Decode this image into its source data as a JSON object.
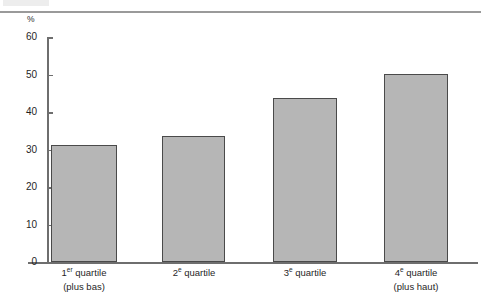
{
  "chart_data": {
    "type": "bar",
    "title": "",
    "subtitle": "",
    "xlabel": "",
    "ylabel": "",
    "unit_label": "%",
    "ylim": [
      0,
      60
    ],
    "ytick_step": 10,
    "yticks": [
      "60",
      "50",
      "40",
      "30",
      "20",
      "10",
      "0"
    ],
    "ytick_values": [
      60,
      50,
      40,
      30,
      20,
      10,
      0
    ],
    "grid": false,
    "legend": false,
    "legend_position": "none",
    "categories": [
      "1er quartile (plus bas)",
      "2e quartile",
      "3e quartile",
      "4e quartile (plus haut)"
    ],
    "values": [
      31.2,
      33.6,
      43.7,
      50.2
    ],
    "series": [
      {
        "name": "",
        "values": [
          31.2,
          33.6,
          43.7,
          50.2
        ]
      }
    ],
    "bars": [
      {
        "value": 31.2,
        "label_main": "1",
        "label_sup": "er",
        "label_rest": " quartile",
        "label_sub": "(plus bas)"
      },
      {
        "value": 33.6,
        "label_main": "2",
        "label_sup": "e",
        "label_rest": " quartile",
        "label_sub": ""
      },
      {
        "value": 43.7,
        "label_main": "3",
        "label_sup": "e",
        "label_rest": " quartile",
        "label_sub": ""
      },
      {
        "value": 50.2,
        "label_main": "4",
        "label_sup": "e",
        "label_rest": " quartile",
        "label_sub": "(plus haut)"
      }
    ],
    "colors": {
      "bar_fill": "#b6b6b6",
      "bar_border": "#4a4a4a",
      "axis": "#6e6e6e",
      "text": "#1f1f1f",
      "top_rule": "#9a9a9a",
      "background": "#ffffff"
    }
  }
}
